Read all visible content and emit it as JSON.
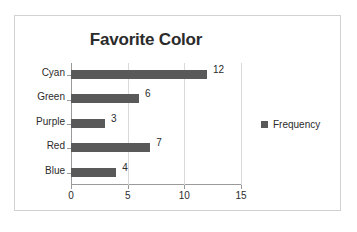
{
  "chart_data": {
    "type": "bar",
    "orientation": "horizontal",
    "title": "Favorite Color",
    "xlabel": "",
    "ylabel": "",
    "categories": [
      "Cyan",
      "Green",
      "Purple",
      "Red",
      "Blue"
    ],
    "values": [
      12,
      6,
      3,
      7,
      4
    ],
    "data_labels": [
      "12",
      "6",
      "3",
      "7",
      "4"
    ],
    "series": [
      {
        "name": "Frequency",
        "values": [
          12,
          6,
          3,
          7,
          4
        ],
        "color": "#595959"
      }
    ],
    "xlim": [
      0,
      15
    ],
    "xticks": [
      0,
      5,
      10,
      15
    ],
    "xtick_labels": [
      "0",
      "5",
      "10",
      "15"
    ],
    "grid": true,
    "grid_axis": "x",
    "legend": {
      "position": "right",
      "entries": [
        "Frequency"
      ]
    }
  },
  "legend": {
    "swatch_name": "frequency-swatch",
    "label": "Frequency"
  },
  "colors": {
    "bar": "#595959",
    "gridline": "#d9d9d9",
    "axis": "#9a9a9a",
    "border": "#d2d2d2",
    "text": "#2b2b2b",
    "background": "#ffffff"
  }
}
